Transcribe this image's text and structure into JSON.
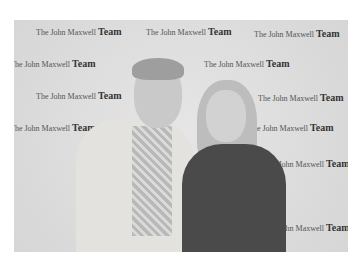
{
  "image": {
    "type": "photograph",
    "color_mode": "grayscale",
    "subject": "Two people posing in front of a step-and-repeat backdrop",
    "backdrop_text": {
      "prefix": "The John Maxwell",
      "emphasis": "Team"
    },
    "people": [
      {
        "position": "left",
        "description": "older man with gray hair, light jacket, plaid shirt, smiling"
      },
      {
        "position": "right",
        "description": "woman with long blonde hair, dark top, smiling"
      }
    ]
  }
}
